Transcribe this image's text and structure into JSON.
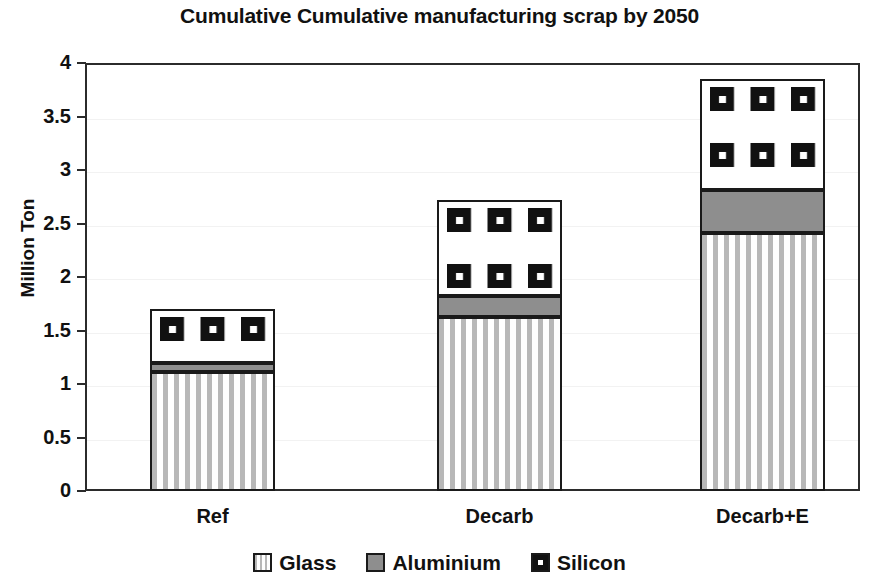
{
  "chart_data": {
    "type": "bar",
    "subtype": "stacked-column",
    "title": "Cumulative Cumulative manufacturing scrap by 2050",
    "xlabel": "",
    "ylabel": "Million Ton",
    "ylim": [
      0,
      4
    ],
    "ytick_labels": [
      "4",
      "3.5",
      "3",
      "2.5",
      "2",
      "1.5",
      "1",
      "0.5",
      "0"
    ],
    "ytick_values": [
      4,
      3.5,
      3,
      2.5,
      2,
      1.5,
      1,
      0.5,
      0
    ],
    "grid": true,
    "legend_position": "bottom",
    "categories": [
      "Ref",
      "Decarb",
      "Decarb+E"
    ],
    "series": [
      {
        "name": "Glass",
        "values": [
          1.11,
          1.63,
          2.41
        ],
        "color": "#ffffff",
        "pattern": "vertical-stripes"
      },
      {
        "name": "Aluminium",
        "values": [
          0.09,
          0.19,
          0.4
        ],
        "color": "#8e8e8e",
        "pattern": "solid-gray"
      },
      {
        "name": "Silicon",
        "values": [
          0.5,
          0.9,
          1.04
        ],
        "color": "#ffffff",
        "pattern": "black-square-dots"
      }
    ],
    "totals": [
      1.7,
      2.72,
      3.85
    ],
    "stack_tops": {
      "glass": [
        1.11,
        1.63,
        2.41
      ],
      "aluminium": [
        1.2,
        1.82,
        2.81
      ],
      "silicon": [
        1.7,
        2.72,
        3.85
      ]
    }
  },
  "legend": {
    "items": [
      {
        "label": "Glass",
        "swatch": "glass-swatch-icon"
      },
      {
        "label": "Aluminium",
        "swatch": "aluminium-swatch-icon"
      },
      {
        "label": "Silicon",
        "swatch": "silicon-swatch-icon"
      }
    ]
  }
}
